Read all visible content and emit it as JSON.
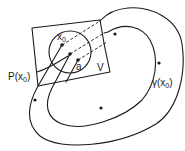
{
  "diagram": {
    "labels": {
      "x0": "x",
      "x0_sub": "0",
      "a": "a",
      "V": "V",
      "P_prefix": "P(x",
      "P_sub": "0",
      "P_suffix": ")",
      "gamma_prefix": "γ(x",
      "gamma_sub": "0",
      "gamma_suffix": ")"
    },
    "elements": [
      {
        "id": "section-V",
        "type": "parallelogram",
        "label": "V"
      },
      {
        "id": "neighborhood",
        "type": "circle"
      },
      {
        "id": "point-x0",
        "type": "point",
        "label": "x0"
      },
      {
        "id": "point-P-x0",
        "type": "point",
        "label": "P(x0)"
      },
      {
        "id": "point-a",
        "type": "point",
        "label": "a"
      },
      {
        "id": "orbit-gamma",
        "type": "closed-curve",
        "label": "γ(x0)"
      },
      {
        "id": "trajectory-from-x0",
        "type": "curve"
      }
    ],
    "colors": {
      "ink": "#1a1a1a",
      "background": "#ffffff"
    }
  }
}
